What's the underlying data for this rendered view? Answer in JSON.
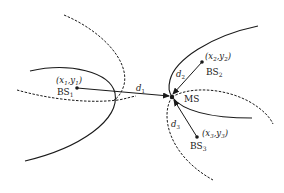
{
  "diagram": {
    "base_stations": [
      {
        "name": "BS",
        "sub": "1",
        "coord": "(x",
        "coord_sub_x": "1",
        "coord_sep": ",y",
        "coord_sub_y": "1",
        "coord_end": ")"
      },
      {
        "name": "BS",
        "sub": "2",
        "coord": "(x",
        "coord_sub_x": "2",
        "coord_sep": ",y",
        "coord_sub_y": "2",
        "coord_end": ")"
      },
      {
        "name": "BS",
        "sub": "3",
        "coord": "(x",
        "coord_sub_x": "3",
        "coord_sep": ",y",
        "coord_sub_y": "3",
        "coord_end": ")"
      }
    ],
    "mobile_station": {
      "name": "MS"
    },
    "distances": [
      {
        "name": "d",
        "sub": "1"
      },
      {
        "name": "d",
        "sub": "2"
      },
      {
        "name": "d",
        "sub": "3"
      }
    ],
    "colors": {
      "stroke": "#1a1a1a",
      "background": "#ffffff"
    }
  }
}
